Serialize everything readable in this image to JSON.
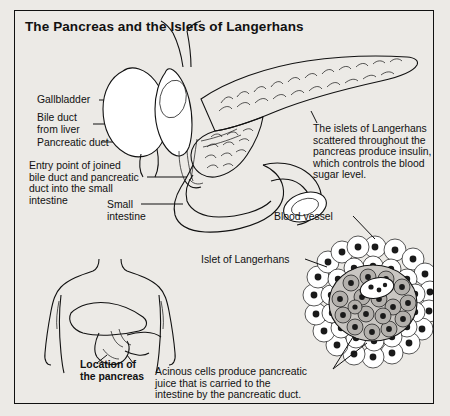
{
  "figure": {
    "title": "The Pancreas and the Islets of Langerhans",
    "border_color": "#111111",
    "background_color": "#eceae6"
  },
  "labels": {
    "gallbladder": "Gallbladder",
    "bile_duct_from_liver": "Bile duct\nfrom liver",
    "pancreatic_duct": "Pancreatic duct",
    "entry_point": "Entry point of joined\nbile duct and pancreatic\nduct into the small\nintestine",
    "small_intestine": "Small\nintestine",
    "blood_vessel": "Blood vessel",
    "islet_of_langerhans": "Islet of Langerhans",
    "location_of_pancreas": "Location of\nthe pancreas"
  },
  "callouts": {
    "islets_text": "The islets of Langerhans\nscattered throughout the\npancreas produce insulin,\nwhich controls the blood\nsugar level.",
    "acinous_text": "Acinous cells produce pancreatic\njuice that is carried to the\nintestine by the pancreatic duct."
  },
  "diagrams": {
    "pancreas_anatomy": "pancreas-duodenum-gallbladder-drawing",
    "torso": "human-torso-organ-location-drawing",
    "islet_micrograph": "islet-of-langerhans-cell-cluster-drawing"
  }
}
